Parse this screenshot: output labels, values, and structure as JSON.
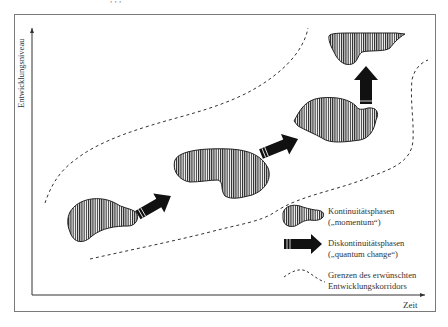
{
  "figure": {
    "top_cut_text": ",          ,                   ,",
    "y_axis_label": "Entwicklungsniveau",
    "x_axis_label": "Zeit"
  },
  "legend": {
    "items": [
      {
        "symbol": "hatched-blob",
        "line1": "Kontinuitätsphasen",
        "line2": "(„momentum“)"
      },
      {
        "symbol": "black-arrow",
        "line1": "Diskontinuitätsphasen",
        "line2": "(„quantum change“)"
      },
      {
        "symbol": "dashed-line",
        "line1": "Grenzen des erwünschten",
        "line2": "Entwicklungskorridors"
      }
    ]
  },
  "elements": {
    "continuity_phases": 4,
    "discontinuity_arrows": 3,
    "corridor_boundaries": 2
  },
  "colors": {
    "frame": "#7a7a7a",
    "axis": "#333333",
    "arrow": "#111111",
    "hatch": "#222222",
    "background": "#ffffff"
  }
}
